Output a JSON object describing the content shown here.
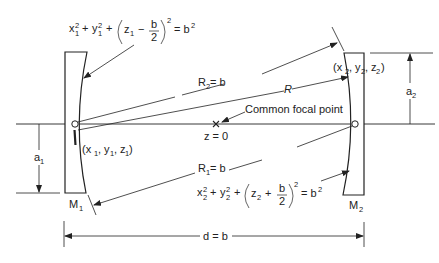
{
  "diagram": {
    "mirrors": [
      {
        "id": "M1",
        "label": "M",
        "subscript": "1"
      },
      {
        "id": "M2",
        "label": "M",
        "subscript": "2"
      }
    ],
    "equations": {
      "mirror1": {
        "x": "x",
        "y": "y",
        "z": "z",
        "sub": "1",
        "sup": "2",
        "sign": "−",
        "frac_num": "b",
        "frac_den": "2",
        "rhs": "= b",
        "rhs_sup": "2",
        "plus": "+"
      },
      "mirror2": {
        "x": "x",
        "y": "y",
        "z": "z",
        "sub": "2",
        "sup": "2",
        "sign": "+",
        "frac_num": "b",
        "frac_den": "2",
        "rhs": "= b",
        "rhs_sup": "2",
        "plus": "+"
      }
    },
    "points": {
      "p1": {
        "open": "(x",
        "sub": "1",
        "mid1": ", y",
        "mid2": ", z",
        "close": ")"
      },
      "p2": {
        "open": "(x",
        "sub": "2",
        "mid1": ", y",
        "mid2": ", z",
        "close": ")"
      }
    },
    "labels": {
      "R2": {
        "main": "R",
        "sub": "2",
        "rest": " = b"
      },
      "R1": {
        "main": "R",
        "sub": "1",
        "rest": " = b"
      },
      "R": "R",
      "focal_point": "Common focal point",
      "z0": "z = 0",
      "d": "d = b",
      "a1": {
        "main": "a",
        "sub": "1"
      },
      "a2": {
        "main": "a",
        "sub": "2"
      }
    },
    "colors": {
      "line": "#222222",
      "background": "#ffffff"
    }
  }
}
